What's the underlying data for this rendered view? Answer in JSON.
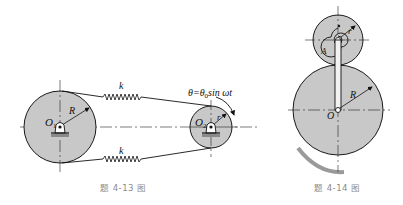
{
  "figures": [
    {
      "id": "4-13",
      "caption": "题 4-13 图",
      "labels": {
        "spring_top": "k",
        "spring_bottom": "k",
        "left_center": "O",
        "left_center_sub": "1",
        "left_radius": "R",
        "right_center": "O",
        "right_center_sub": "2",
        "right_radius": "r",
        "motion": "θ=θ",
        "motion_sub": "0",
        "motion_rest": "sin ωt"
      }
    },
    {
      "id": "4-14",
      "caption": "题 4-14 图",
      "labels": {
        "small_radius": "r",
        "point": "A",
        "big_radius": "R",
        "big_center": "O"
      }
    }
  ],
  "colors": {
    "disk_fill": "#c8c8c8",
    "stroke": "#1a1a1a",
    "caption": "#8a8a8a",
    "ground_shadow": "#9a9a9a"
  }
}
